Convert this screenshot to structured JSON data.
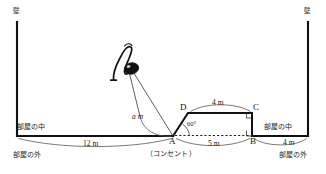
{
  "figure": {
    "walls": {
      "left_label": "壁",
      "right_label": "壁"
    },
    "regions": {
      "inside_left": "部屋の中",
      "outside_left": "部屋の外",
      "inside_right": "部屋の中",
      "outside_right": "部屋の外"
    },
    "points": {
      "a": "A",
      "b": "B",
      "c": "C",
      "d": "D"
    },
    "outlet_note": "（コンセント）",
    "cord_label": "a m",
    "angle_label": "60°",
    "dimensions": {
      "left_floor": "12 m",
      "top_dc": "4 m",
      "base_ab": "5 m",
      "right_floor": "4 m"
    },
    "colors": {
      "stroke": "#111111",
      "thin": "#444444",
      "text": "#1a1a1a",
      "background": "#ffffff"
    }
  }
}
